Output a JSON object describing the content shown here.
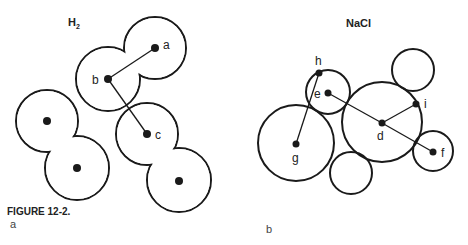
{
  "figure": {
    "caption": "FIGURE 12-2.",
    "panel_a_label": "a",
    "panel_b_label": "b"
  },
  "panel_a": {
    "title_main": "H",
    "title_sub": "2",
    "molecules": [
      {
        "name": "H2 molecule top",
        "atoms": [
          "a",
          "b"
        ]
      },
      {
        "name": "H2 molecule left",
        "atoms": [
          "",
          ""
        ]
      },
      {
        "name": "H2 molecule right",
        "atoms": [
          "c",
          ""
        ]
      }
    ],
    "atom_labels": {
      "a": "a",
      "b": "b",
      "c": "c"
    },
    "connections": [
      [
        "a",
        "b"
      ],
      [
        "b",
        "c"
      ]
    ]
  },
  "panel_b": {
    "title": "NaCl",
    "atom_labels": {
      "d": "d",
      "e": "e",
      "f": "f",
      "g": "g",
      "h": "h",
      "i": "i"
    },
    "connections": [
      [
        "h",
        "g"
      ],
      [
        "e",
        "d"
      ],
      [
        "d",
        "i"
      ],
      [
        "d",
        "f"
      ]
    ]
  }
}
